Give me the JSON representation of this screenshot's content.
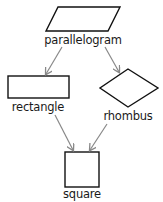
{
  "diagram": {
    "type": "hierarchy",
    "colors": {
      "shape_stroke": "#111111",
      "arrow": "#888888",
      "text": "#1a1a1a"
    },
    "nodes": [
      {
        "id": "parallelogram",
        "label": "parallelogram",
        "shape": "parallelogram"
      },
      {
        "id": "rectangle",
        "label": "rectangle",
        "shape": "rectangle"
      },
      {
        "id": "rhombus",
        "label": "rhombus",
        "shape": "rhombus"
      },
      {
        "id": "square",
        "label": "square",
        "shape": "square"
      }
    ],
    "edges": [
      {
        "from": "parallelogram",
        "to": "rectangle"
      },
      {
        "from": "parallelogram",
        "to": "rhombus"
      },
      {
        "from": "rectangle",
        "to": "square"
      },
      {
        "from": "rhombus",
        "to": "square"
      }
    ]
  }
}
